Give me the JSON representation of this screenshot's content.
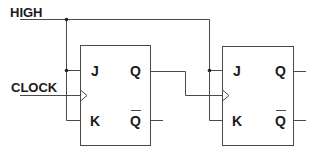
{
  "diagram": {
    "type": "jk-flip-flop-counter",
    "colors": {
      "line": "#4a4a4a",
      "text": "#1a1a1a",
      "background": "#ffffff"
    },
    "inputs": [
      {
        "label": "HIGH"
      },
      {
        "label": "CLOCK"
      }
    ],
    "flip_flops": [
      {
        "pins": {
          "j": "J",
          "k": "K",
          "q": "Q",
          "q_bar": "Q"
        }
      },
      {
        "pins": {
          "j": "J",
          "k": "K",
          "q": "Q",
          "q_bar": "Q"
        }
      }
    ]
  }
}
